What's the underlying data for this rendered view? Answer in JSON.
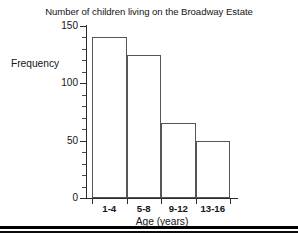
{
  "chart_data": {
    "type": "bar",
    "title": "Number of children living on the Broadway Estate",
    "xlabel": "Age (years)",
    "ylabel": "Frequency",
    "categories": [
      "1-4",
      "5-8",
      "9-12",
      "13-16"
    ],
    "values": [
      140,
      125,
      65,
      50
    ],
    "ylim": [
      0,
      150
    ],
    "ytick_labels": [
      "0",
      "50",
      "100",
      "150"
    ],
    "ytick_values": [
      0,
      50,
      100,
      150
    ],
    "yminor_step": 10,
    "grid": false,
    "legend": "none",
    "bar_fill": "#ffffff",
    "bar_stroke": "#555555",
    "axis_color": "#2b2b2b",
    "background": "#ffffff",
    "text_color": "#141414"
  }
}
